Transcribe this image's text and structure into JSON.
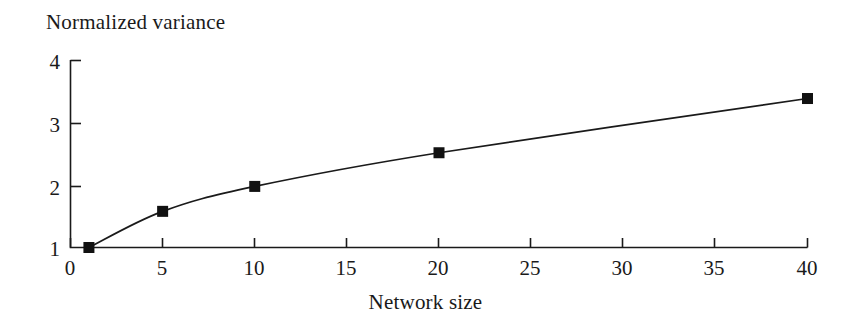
{
  "chart_data": {
    "type": "line",
    "title": "",
    "ylabel": "Normalized variance",
    "xlabel": "Network size",
    "x": [
      1,
      5,
      10,
      20,
      40
    ],
    "values": [
      1.0,
      1.58,
      1.98,
      2.52,
      3.39
    ],
    "series": [
      {
        "name": "Normalized variance",
        "x": [
          1,
          5,
          10,
          20,
          40
        ],
        "values": [
          1.0,
          1.58,
          1.98,
          2.52,
          3.39
        ]
      }
    ],
    "xlim": [
      0,
      40
    ],
    "ylim": [
      1,
      4
    ],
    "xticks": [
      0,
      5,
      10,
      15,
      20,
      25,
      30,
      35,
      40
    ],
    "yticks": [
      1,
      2,
      3,
      4
    ],
    "xtick_labels": [
      "0",
      "5",
      "10",
      "15",
      "20",
      "25",
      "30",
      "35",
      "40"
    ],
    "ytick_labels": [
      "1",
      "2",
      "3",
      "4"
    ],
    "grid": false,
    "legend": false,
    "marker": "filled-square",
    "line_color": "#1a1a1a",
    "marker_color": "#111111",
    "background_color": "#ffffff"
  },
  "axes": {
    "y_axis_title": "Normalized variance",
    "x_axis_title": "Network size"
  }
}
